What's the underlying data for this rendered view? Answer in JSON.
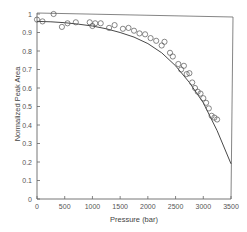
{
  "chart_data": {
    "type": "scatter",
    "title": "",
    "xlabel": "Pressure (bar)",
    "ylabel": "Normalized Peak Area",
    "xlim": [
      0,
      3500
    ],
    "ylim": [
      0,
      1
    ],
    "xticks": [
      0,
      500,
      1000,
      1500,
      2000,
      2500,
      3000,
      3500
    ],
    "yticks": [
      0,
      0.1,
      0.2,
      0.3,
      0.4,
      0.5,
      0.6,
      0.7,
      0.8,
      0.9,
      1
    ],
    "xtick_labels": [
      "0",
      "500",
      "1000",
      "1500",
      "2000",
      "2500",
      "3000",
      "3500"
    ],
    "ytick_labels": [
      "0",
      "0.1",
      "0.2",
      "0.3",
      "0.4",
      "0.5",
      "0.6",
      "0.7",
      "0.8",
      "0.9",
      "1"
    ],
    "grid": false,
    "legend": null,
    "series": [
      {
        "name": "Measured",
        "kind": "scatter",
        "marker": "open-circle",
        "x": [
          0,
          100,
          300,
          450,
          550,
          700,
          950,
          1000,
          1050,
          1150,
          1300,
          1400,
          1550,
          1650,
          1750,
          1850,
          1950,
          2050,
          2150,
          2250,
          2300,
          2400,
          2450,
          2550,
          2600,
          2650,
          2700,
          2750,
          2800,
          2850,
          2900,
          2950,
          3000,
          3050,
          3100,
          3150,
          3200,
          3250
        ],
        "y": [
          0.97,
          0.96,
          1.0,
          0.93,
          0.95,
          0.955,
          0.955,
          0.935,
          0.95,
          0.95,
          0.925,
          0.94,
          0.92,
          0.925,
          0.91,
          0.895,
          0.89,
          0.87,
          0.855,
          0.83,
          0.85,
          0.79,
          0.77,
          0.73,
          0.7,
          0.72,
          0.675,
          0.68,
          0.63,
          0.6,
          0.58,
          0.57,
          0.545,
          0.52,
          0.49,
          0.45,
          0.44,
          0.43
        ]
      },
      {
        "name": "Fit",
        "kind": "line",
        "x": [
          0,
          250,
          500,
          750,
          1000,
          1250,
          1500,
          1750,
          2000,
          2250,
          2500,
          2750,
          3000,
          3250,
          3500
        ],
        "y": [
          0.96,
          0.958,
          0.953,
          0.945,
          0.935,
          0.92,
          0.9,
          0.875,
          0.84,
          0.79,
          0.72,
          0.63,
          0.52,
          0.37,
          0.19
        ]
      }
    ]
  }
}
